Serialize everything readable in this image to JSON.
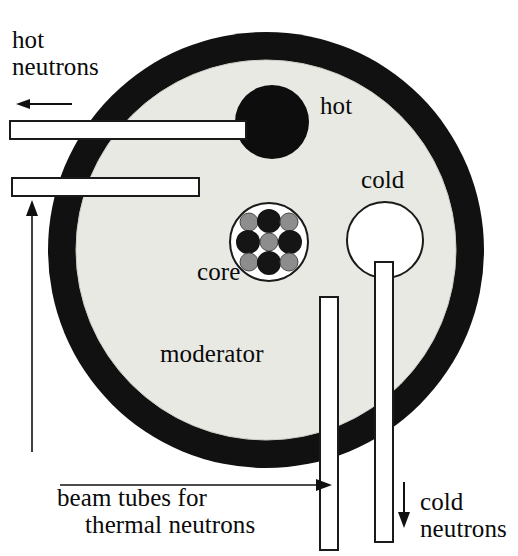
{
  "diagram": {
    "labels": {
      "hot_neutrons": "hot\nneutrons",
      "hot": "hot",
      "cold": "cold",
      "core": "core",
      "moderator": "moderator",
      "beam_tubes_line1": "beam tubes for",
      "beam_tubes_line2": "thermal neutrons",
      "cold_neutrons": "cold\nneutrons"
    },
    "colors": {
      "reflector_ring": "#111111",
      "moderator_fill": "#e9e9e4",
      "hot_source": "#0d0d0d",
      "cold_source": "#ffffff",
      "tube_fill": "#ffffff",
      "outline": "#1a1a1a",
      "fuel_dark": "#151515",
      "fuel_light": "#8d8d8d",
      "background": "#ffffff"
    },
    "geometry": {
      "outer_circle": {
        "cx": 266,
        "cy": 250,
        "r": 218
      },
      "moderator_circle": {
        "cx": 266,
        "cy": 250,
        "r": 190
      },
      "hot_source_circle": {
        "cx": 272,
        "cy": 122,
        "r": 37
      },
      "cold_source_circle": {
        "cx": 385,
        "cy": 240,
        "r": 38
      },
      "core_circle": {
        "cx": 269,
        "cy": 242,
        "r": 39
      }
    },
    "core_elements": [
      {
        "name": "fuel-corner-nw",
        "cx": -20,
        "cy": -20,
        "r": 9,
        "shade": "light"
      },
      {
        "name": "fuel-edge-n",
        "cx": 0,
        "cy": -21,
        "r": 12,
        "shade": "dark"
      },
      {
        "name": "fuel-corner-ne",
        "cx": 20,
        "cy": -20,
        "r": 9,
        "shade": "light"
      },
      {
        "name": "fuel-edge-w",
        "cx": -21,
        "cy": 0,
        "r": 12,
        "shade": "dark"
      },
      {
        "name": "fuel-center",
        "cx": 0,
        "cy": 0,
        "r": 9,
        "shade": "light"
      },
      {
        "name": "fuel-edge-e",
        "cx": 21,
        "cy": 0,
        "r": 12,
        "shade": "dark"
      },
      {
        "name": "fuel-corner-sw",
        "cx": -20,
        "cy": 20,
        "r": 9,
        "shade": "light"
      },
      {
        "name": "fuel-edge-s",
        "cx": 0,
        "cy": 21,
        "r": 12,
        "shade": "dark"
      },
      {
        "name": "fuel-corner-se",
        "cx": 20,
        "cy": 20,
        "r": 9,
        "shade": "light"
      }
    ],
    "tubes": [
      {
        "name": "hot-beam-tube-upper",
        "x": 10,
        "y": 121,
        "w": 236,
        "h": 18,
        "orientation": "horizontal"
      },
      {
        "name": "beam-tube-lower",
        "x": 12,
        "y": 178,
        "w": 187,
        "h": 18,
        "orientation": "horizontal"
      },
      {
        "name": "thermal-beam-tube-vertical",
        "x": 320,
        "y": 297,
        "w": 18,
        "h": 253,
        "orientation": "vertical"
      },
      {
        "name": "cold-beam-tube-vertical",
        "x": 375,
        "y": 262,
        "w": 18,
        "h": 280,
        "orientation": "vertical"
      }
    ],
    "arrows": [
      {
        "name": "hot-neutron-flow-arrow",
        "direction": "left",
        "x1": 72,
        "y1": 104,
        "x2": 18,
        "y2": 104
      },
      {
        "name": "thermal-neutron-up-arrow",
        "direction": "up",
        "x1": 32,
        "y1": 452,
        "x2": 32,
        "y2": 205
      },
      {
        "name": "thermal-neutron-right-arrow",
        "direction": "right",
        "x1": 60,
        "y1": 485,
        "x2": 330,
        "y2": 485
      },
      {
        "name": "cold-neutron-down-arrow",
        "direction": "down",
        "x1": 404,
        "y1": 482,
        "x2": 404,
        "y2": 528
      }
    ]
  }
}
